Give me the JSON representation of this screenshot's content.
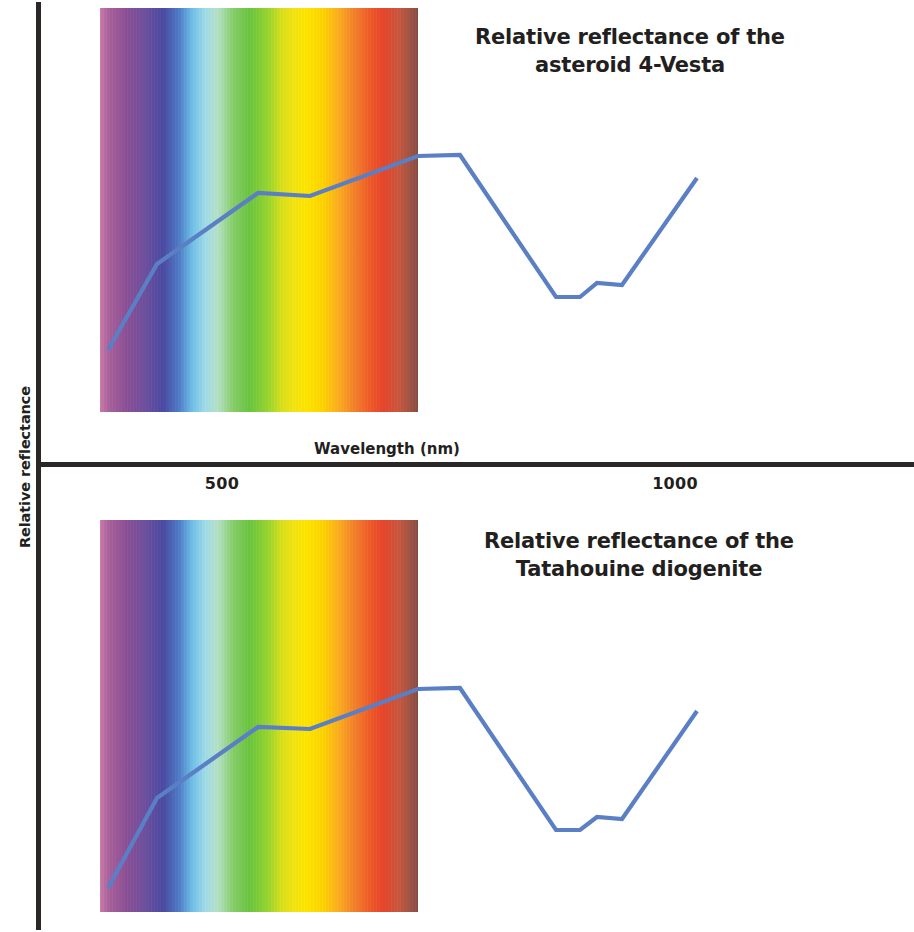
{
  "axes": {
    "ylabel": "Relative reflectance",
    "xlabel": "Wavelength (nm)",
    "tick_500": "500",
    "tick_1000": "1000"
  },
  "panels": {
    "top": {
      "title": "Relative reflectance of the asteroid 4-Vesta"
    },
    "bottom": {
      "title": "Relative reflectance of the Tatahouine diogenite"
    }
  },
  "colors": {
    "curve": "#5b7fc4",
    "axis": "#2b2726",
    "text": "#231f20",
    "background": "#ffffff"
  },
  "chart_data": {
    "type": "line",
    "xlabel": "Wavelength (nm)",
    "ylabel": "Relative reflectance",
    "xlim": [
      380,
      1120
    ],
    "xticks": [
      500,
      1000
    ],
    "ytick_labels": [],
    "grid": false,
    "legend": "none",
    "annotations": [
      "Visible spectrum colour band overlaid from approximately 400 nm to 700 nm",
      "Broad absorption band centred near 900 nm (pyroxene 1-micron band)"
    ],
    "series": [
      {
        "name": "Relative reflectance of the asteroid 4-Vesta",
        "panel": "top",
        "x": [
          400,
          435,
          510,
          575,
          612,
          700,
          735,
          805,
          860,
          880,
          900,
          920,
          1000,
          1060
        ],
        "y_relative": [
          0.18,
          0.4,
          0.63,
          0.75,
          0.74,
          0.85,
          0.85,
          0.52,
          0.34,
          0.34,
          0.38,
          0.37,
          0.66,
          0.8
        ],
        "vertices_px": [
          [
            108,
            350
          ],
          [
            157,
            264
          ],
          [
            258,
            193
          ],
          [
            310,
            196
          ],
          [
            418,
            156
          ],
          [
            460,
            155
          ],
          [
            556,
            297
          ],
          [
            580,
            297
          ],
          [
            597,
            283
          ],
          [
            622,
            285
          ],
          [
            697,
            178
          ]
        ]
      },
      {
        "name": "Relative reflectance of the Tatahouine diogenite",
        "panel": "bottom",
        "x": [
          400,
          435,
          510,
          575,
          612,
          700,
          735,
          805,
          860,
          880,
          900,
          920,
          1000,
          1060
        ],
        "y_relative": [
          0.18,
          0.4,
          0.63,
          0.75,
          0.74,
          0.85,
          0.85,
          0.52,
          0.34,
          0.34,
          0.38,
          0.37,
          0.66,
          0.8
        ],
        "vertices_px": [
          [
            108,
            888
          ],
          [
            157,
            798
          ],
          [
            258,
            727
          ],
          [
            310,
            729
          ],
          [
            418,
            689
          ],
          [
            460,
            688
          ],
          [
            556,
            830
          ],
          [
            580,
            830
          ],
          [
            597,
            817
          ],
          [
            622,
            819
          ],
          [
            697,
            711
          ]
        ]
      }
    ],
    "spectrum_band": {
      "x_start_px": 100,
      "x_end_px": 418,
      "description": "Continuous visible-light spectrum from violet through blue, cyan, green, yellow, orange to deep red"
    }
  }
}
